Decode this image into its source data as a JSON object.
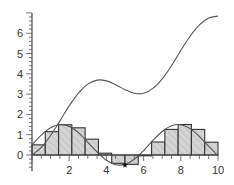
{
  "chart_data": {
    "type": "bar",
    "title": "",
    "xlabel": "",
    "ylabel": "",
    "xlim": [
      0,
      10
    ],
    "ylim": [
      -0.7,
      7.0
    ],
    "grid": false,
    "legend": null,
    "x_ticks": [
      2,
      4,
      6,
      8,
      10
    ],
    "y_ticks": [
      0,
      1,
      2,
      3,
      4,
      5,
      6
    ],
    "x_tick_labels": [
      "2",
      "4",
      "6",
      "8",
      "10"
    ],
    "y_tick_labels": [
      "0",
      "1",
      "2",
      "3",
      "4",
      "5",
      "6"
    ],
    "bars": {
      "name": "Left Riemann sum rectangles of f(x) = sin(x) + 0.5",
      "bar_width": 0.714,
      "x_left": [
        0.0,
        0.714,
        1.429,
        2.143,
        2.857,
        3.571,
        4.286,
        5.0,
        5.714,
        6.429,
        7.143,
        7.857,
        8.571,
        9.286
      ],
      "values": [
        0.5,
        1.15,
        1.49,
        1.34,
        0.78,
        0.09,
        -0.41,
        -0.46,
        -0.04,
        0.64,
        1.26,
        1.5,
        1.26,
        0.63
      ],
      "fill": "#d4d4d4",
      "hatch": "diagonal"
    },
    "series": [
      {
        "name": "f(x) = sin(x) + 0.5",
        "type": "line",
        "x": [
          0,
          0.5,
          1,
          1.5,
          2,
          2.5,
          3,
          3.5,
          4,
          4.5,
          5,
          5.5,
          6,
          6.5,
          7,
          7.5,
          8,
          8.5,
          9,
          9.5,
          10
        ],
        "values": [
          0.5,
          0.98,
          1.34,
          1.5,
          1.41,
          1.1,
          0.64,
          0.15,
          -0.26,
          -0.48,
          -0.46,
          -0.21,
          0.22,
          0.72,
          1.16,
          1.44,
          1.49,
          1.3,
          0.91,
          0.42,
          -0.04
        ],
        "color": "#555555"
      },
      {
        "name": "F(x) = integral of f = 1 - cos(x) + 0.5x",
        "type": "line",
        "x": [
          0,
          0.5,
          1,
          1.5,
          2,
          2.5,
          3,
          3.5,
          4,
          4.5,
          5,
          5.5,
          6,
          6.5,
          7,
          7.5,
          8,
          8.5,
          9,
          9.5,
          10
        ],
        "values": [
          0.0,
          0.37,
          0.96,
          1.68,
          2.42,
          3.05,
          3.49,
          3.69,
          3.65,
          3.46,
          3.22,
          3.04,
          3.04,
          3.28,
          3.75,
          4.4,
          5.15,
          5.85,
          6.41,
          6.75,
          6.84
        ],
        "color": "#555555"
      }
    ],
    "annotations": [
      {
        "type": "star-marker",
        "x": 5.0,
        "y": -0.4
      }
    ]
  }
}
